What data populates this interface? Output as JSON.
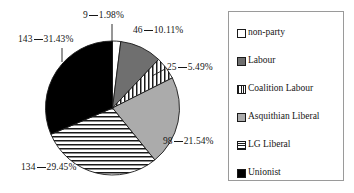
{
  "chart_data": {
    "type": "pie",
    "title": "",
    "xlabel": "",
    "ylabel": "",
    "legend_position": "right",
    "grid": false,
    "total": 455,
    "categories": [
      "non-party",
      "Labour",
      "Coalition Labour",
      "Asquithian Liberal",
      "LG Liberal",
      "Unionist"
    ],
    "values": [
      9,
      46,
      25,
      98,
      134,
      143
    ],
    "percentages": [
      1.98,
      10.11,
      5.49,
      21.54,
      29.45,
      31.43
    ],
    "slice_fills": [
      "white",
      "dark-gray",
      "vertical-stripes",
      "light-gray",
      "horizontal-stripes",
      "black"
    ],
    "data_labels": [
      "9__1.98%",
      "46__10.11%",
      "25__5.49%",
      "98__21.54%",
      "134__29.45%",
      "143__31.43%"
    ]
  },
  "labels": {
    "nonparty": {
      "value": "9",
      "percent": "1.98%"
    },
    "labour": {
      "value": "46",
      "percent": "10.11%"
    },
    "coalition": {
      "value": "25",
      "percent": "5.49%"
    },
    "asquithian": {
      "value": "98",
      "percent": "21.54%"
    },
    "lgliberal": {
      "value": "134",
      "percent": "29.45%"
    },
    "unionist": {
      "value": "143",
      "percent": "31.43%"
    }
  },
  "legend": {
    "items": [
      {
        "label": "non-party",
        "fill": "white"
      },
      {
        "label": "Labour",
        "fill": "dark-gray"
      },
      {
        "label": "Coalition Labour",
        "fill": "vertical-stripes"
      },
      {
        "label": "Asquithian Liberal",
        "fill": "light-gray"
      },
      {
        "label": "LG Liberal",
        "fill": "horizontal-stripes"
      },
      {
        "label": "Unionist",
        "fill": "black"
      }
    ]
  },
  "colors": {
    "outline": "#1a1a1a",
    "white": "#ffffff",
    "dark_gray": "#6f6f6f",
    "light_gray": "#ababab",
    "black": "#000000",
    "legend_border": "#9a9a9a",
    "background": "#ffffff"
  }
}
